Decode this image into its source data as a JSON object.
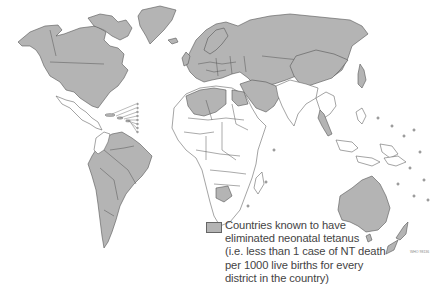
{
  "map": {
    "title": "",
    "projection": "world",
    "colors": {
      "eliminated": "#b4b4b4",
      "not_eliminated": "#ffffff",
      "border": "#555555"
    },
    "shaded_regions": [
      "North America",
      "Greenland",
      "Europe",
      "Russia",
      "Central Asia",
      "China",
      "Japan",
      "South America",
      "Algeria",
      "Libya",
      "Egypt",
      "Middle East",
      "Iran",
      "Turkey",
      "Botswana",
      "Thailand",
      "Malaysia",
      "Australia",
      "New Zealand",
      "Pacific islands",
      "Caribbean islands"
    ],
    "unshaded_regions": [
      "Africa (most)",
      "South Asia",
      "Southeast Asia (parts)",
      "Indonesia",
      "Papua New Guinea",
      "Mexico",
      "Central America",
      "Colombia"
    ]
  },
  "legend": {
    "swatch_label": "eliminated",
    "text": "Countries known to have eliminated neonatal tetanus (i.e. less than 1 case of NT death per 1000 live births for every district in the country)",
    "lines": [
      "Countries known to have",
      "eliminated neonatal tetanus",
      "(i.e. less than 1 case of NT death",
      "per 1000 live births for every",
      "district in the country)"
    ]
  },
  "credit": "WHO 98136"
}
